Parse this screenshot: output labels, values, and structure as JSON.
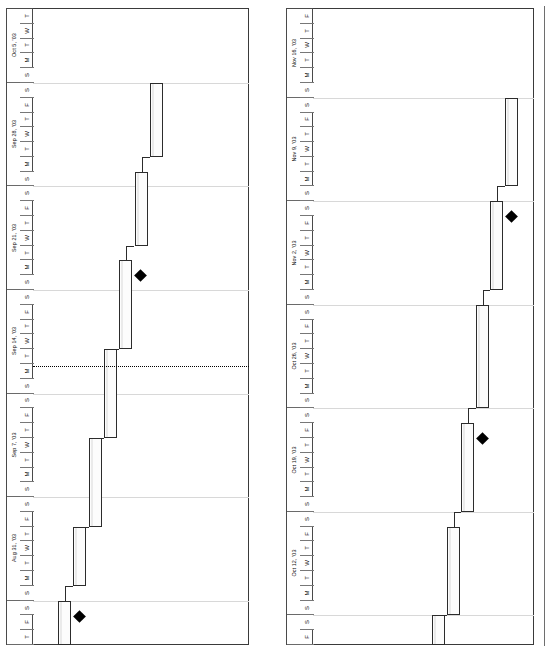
{
  "document": {
    "type": "gantt-chart",
    "orientation": "rotated-90",
    "panel_count": 2
  },
  "chart_data": {
    "type": "bar",
    "title": "",
    "xlabel": "",
    "ylabel": "",
    "grid": true,
    "legend": "none",
    "panels": [
      {
        "id": "left",
        "name": "left-panel",
        "axis_start": "Aug 28, '03",
        "axis_end": "Oct 9, '03",
        "week_headers": [
          "Aug 31, '03",
          "Sep 7, '03",
          "Sep 14, '03",
          "Sep 21, '03",
          "Sep 28, '03",
          "Oct 5, '03"
        ],
        "day_letters_full_week": [
          "S",
          "M",
          "T",
          "W",
          "T",
          "F",
          "S"
        ],
        "leading_days": [
          "T",
          "F",
          "S"
        ],
        "trailing_days": [
          "S",
          "M",
          "T",
          "W",
          "T"
        ],
        "today_marker": "Sep 15, '03",
        "tasks": [
          {
            "index": 1,
            "start_day": 0,
            "duration_days": 3,
            "milestone": true
          },
          {
            "index": 2,
            "start_day": 4,
            "duration_days": 4,
            "milestone": false
          },
          {
            "index": 3,
            "start_day": 8,
            "duration_days": 6,
            "milestone": false
          },
          {
            "index": 4,
            "start_day": 14,
            "duration_days": 6,
            "milestone": false
          },
          {
            "index": 5,
            "start_day": 20,
            "duration_days": 6,
            "milestone": true
          },
          {
            "index": 6,
            "start_day": 27,
            "duration_days": 5,
            "milestone": false
          },
          {
            "index": 7,
            "start_day": 33,
            "duration_days": 5,
            "milestone": false
          }
        ]
      },
      {
        "id": "right",
        "name": "right-panel",
        "axis_start": "Oct 10, '03",
        "axis_end": "Nov 21, '03",
        "week_headers": [
          "Oct 12, '03",
          "Oct 19, '03",
          "Oct 26, '03",
          "Nov 2, '03",
          "Nov 9, '03",
          "Nov 16, '03"
        ],
        "day_letters_full_week": [
          "S",
          "M",
          "T",
          "W",
          "T",
          "F",
          "S"
        ],
        "leading_days": [
          "F",
          "S"
        ],
        "trailing_days": [
          "S",
          "M",
          "T",
          "W",
          "T",
          "F"
        ],
        "today_marker": null,
        "tasks": [
          {
            "index": 8,
            "start_day": 0,
            "duration_days": 2,
            "milestone": false
          },
          {
            "index": 9,
            "start_day": 2,
            "duration_days": 6,
            "milestone": false
          },
          {
            "index": 10,
            "start_day": 9,
            "duration_days": 6,
            "milestone": true
          },
          {
            "index": 11,
            "start_day": 16,
            "duration_days": 7,
            "milestone": false
          },
          {
            "index": 12,
            "start_day": 24,
            "duration_days": 6,
            "milestone": true
          },
          {
            "index": 13,
            "start_day": 31,
            "duration_days": 6,
            "milestone": false
          }
        ]
      }
    ],
    "colors": {
      "bar_fill": "#fcfcfc",
      "bar_border": "#2c2c2c",
      "gridline": "#d8d8d8",
      "milestone": "#000000",
      "today_line": "#000000",
      "frame": "#3a3a3a"
    }
  },
  "left_panel": {
    "weeks": [
      {
        "label": "",
        "days": [
          "T",
          "F",
          "S"
        ]
      },
      {
        "label": "Aug 31, '03",
        "days": [
          "S",
          "M",
          "T",
          "W",
          "T",
          "F",
          "S"
        ]
      },
      {
        "label": "Sep 7, '03",
        "days": [
          "S",
          "M",
          "T",
          "W",
          "T",
          "F",
          "S"
        ]
      },
      {
        "label": "Sep 14, '03",
        "days": [
          "S",
          "M",
          "T",
          "W",
          "T",
          "F",
          "S"
        ]
      },
      {
        "label": "Sep 21, '03",
        "days": [
          "S",
          "M",
          "T",
          "W",
          "T",
          "F",
          "S"
        ]
      },
      {
        "label": "Sep 28, '03",
        "days": [
          "S",
          "M",
          "T",
          "W",
          "T",
          "F",
          "S"
        ]
      },
      {
        "label": "Oct 5, '03",
        "days": [
          "S",
          "M",
          "T",
          "W",
          "T"
        ]
      }
    ]
  },
  "right_panel": {
    "weeks": [
      {
        "label": "",
        "days": [
          "F",
          "S"
        ]
      },
      {
        "label": "Oct 12, '03",
        "days": [
          "S",
          "M",
          "T",
          "W",
          "T",
          "F",
          "S"
        ]
      },
      {
        "label": "Oct 19, '03",
        "days": [
          "S",
          "M",
          "T",
          "W",
          "T",
          "F",
          "S"
        ]
      },
      {
        "label": "Oct 26, '03",
        "days": [
          "S",
          "M",
          "T",
          "W",
          "T",
          "F",
          "S"
        ]
      },
      {
        "label": "Nov 2, '03",
        "days": [
          "S",
          "M",
          "T",
          "W",
          "T",
          "F",
          "S"
        ]
      },
      {
        "label": "Nov 9, '03",
        "days": [
          "S",
          "M",
          "T",
          "W",
          "T",
          "F",
          "S"
        ]
      },
      {
        "label": "Nov 16, '03",
        "days": [
          "S",
          "M",
          "T",
          "W",
          "T",
          "F"
        ]
      }
    ]
  }
}
